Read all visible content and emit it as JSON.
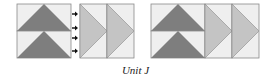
{
  "caption": "Unit J",
  "colors": {
    "background": "#efefef",
    "dark_triangle": "#7e7e7e",
    "light_triangle": "#c4c4c4",
    "outline": "#8a8a8a",
    "arrow": "#111111"
  },
  "groups": [
    {
      "name": "before-assembly",
      "stacked_geese": {
        "x": 17,
        "y": 4,
        "w": 54,
        "h": 54,
        "units": 2,
        "orientation": "up"
      },
      "side_geese": [
        {
          "x": 80,
          "y": 4,
          "w": 27,
          "h": 54,
          "orientation": "right"
        },
        {
          "x": 107,
          "y": 4,
          "w": 27,
          "h": 54,
          "orientation": "right"
        }
      ],
      "arrows": [
        {
          "y": 14
        },
        {
          "y": 28
        },
        {
          "y": 38
        },
        {
          "y": 51
        }
      ]
    },
    {
      "name": "after-assembly",
      "stacked_geese": {
        "x": 151,
        "y": 4,
        "w": 54,
        "h": 54,
        "units": 2,
        "orientation": "up"
      },
      "side_geese": [
        {
          "x": 205,
          "y": 4,
          "w": 27,
          "h": 54,
          "orientation": "right"
        },
        {
          "x": 232,
          "y": 4,
          "w": 27,
          "h": 54,
          "orientation": "right"
        }
      ],
      "arrows": []
    }
  ]
}
